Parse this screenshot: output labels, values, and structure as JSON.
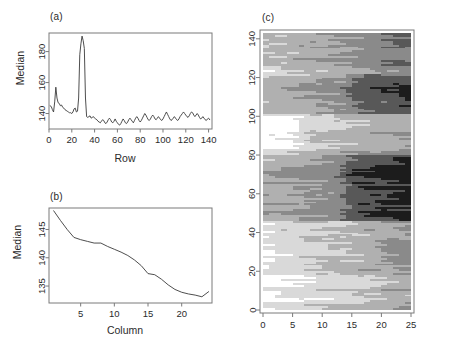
{
  "figure": {
    "panels": [
      {
        "id": "a",
        "label": "(a)"
      },
      {
        "id": "b",
        "label": "(b)"
      },
      {
        "id": "c",
        "label": "(c)"
      }
    ]
  },
  "chart_data": [
    {
      "type": "line",
      "panel": "(a)",
      "title": "",
      "xlabel": "Row",
      "ylabel": "Median",
      "xlim": [
        0,
        143
      ],
      "ylim": [
        130,
        192
      ],
      "xticks": [
        0,
        20,
        40,
        60,
        80,
        100,
        120,
        140
      ],
      "yticks": [
        140,
        160,
        180
      ],
      "grid": false,
      "x": [
        1,
        2,
        3,
        4,
        5,
        6,
        7,
        8,
        9,
        10,
        11,
        12,
        13,
        14,
        15,
        16,
        17,
        18,
        19,
        20,
        21,
        22,
        23,
        24,
        25,
        26,
        27,
        28,
        29,
        30,
        31,
        32,
        33,
        34,
        35,
        36,
        37,
        38,
        39,
        40,
        41,
        42,
        43,
        44,
        45,
        46,
        47,
        48,
        49,
        50,
        51,
        52,
        53,
        54,
        55,
        56,
        57,
        58,
        59,
        60,
        61,
        62,
        63,
        64,
        65,
        66,
        67,
        68,
        69,
        70,
        71,
        72,
        73,
        74,
        75,
        76,
        77,
        78,
        79,
        80,
        81,
        82,
        83,
        84,
        85,
        86,
        87,
        88,
        89,
        90,
        91,
        92,
        93,
        94,
        95,
        96,
        97,
        98,
        99,
        100,
        101,
        102,
        103,
        104,
        105,
        106,
        107,
        108,
        109,
        110,
        111,
        112,
        113,
        114,
        115,
        116,
        117,
        118,
        119,
        120,
        121,
        122,
        123,
        124,
        125,
        126,
        127,
        128,
        129,
        130,
        131,
        132,
        133,
        134,
        135,
        136,
        137,
        138,
        139,
        140,
        141
      ],
      "values": [
        145,
        144.5,
        142.5,
        141,
        147.5,
        157,
        150,
        147,
        146.5,
        145,
        145.5,
        144,
        143.5,
        142.5,
        142,
        141.5,
        141,
        140.5,
        140.5,
        140,
        141,
        143,
        143.5,
        141,
        141.5,
        150,
        178,
        185,
        190,
        187,
        182,
        150,
        138,
        137.5,
        138,
        138.5,
        137,
        137.5,
        138,
        137,
        136.5,
        136,
        135,
        134.5,
        134,
        135,
        136,
        135.5,
        134,
        133.5,
        134.5,
        136,
        137,
        136,
        134.5,
        134,
        135,
        136.5,
        135,
        134,
        133,
        132.5,
        133.5,
        135,
        136.5,
        135.5,
        134,
        133.5,
        134.5,
        136,
        137,
        136,
        135,
        134,
        135.5,
        137,
        138,
        137,
        135.5,
        134.5,
        135.5,
        137,
        138.5,
        140,
        139,
        137.5,
        136,
        135.5,
        136.5,
        138,
        139,
        138,
        136.5,
        136,
        137,
        138,
        137,
        136,
        135.5,
        136.5,
        138,
        139.5,
        141,
        139.5,
        138,
        136.5,
        135.5,
        136,
        137,
        138,
        137,
        136,
        135.5,
        136.5,
        138,
        139,
        140,
        141,
        140,
        139,
        138,
        137.5,
        138.5,
        140,
        141,
        140.5,
        139,
        138,
        139,
        140,
        139,
        137.5,
        136.5,
        137,
        138,
        137,
        136,
        135.5,
        136.5,
        137,
        136
      ]
    },
    {
      "type": "line",
      "panel": "(b)",
      "title": "",
      "xlabel": "Column",
      "ylabel": "Median",
      "xlim": [
        0.3,
        24.5
      ],
      "ylim": [
        132,
        148.8
      ],
      "xticks": [
        5,
        10,
        15,
        20
      ],
      "yticks": [
        135,
        140,
        145
      ],
      "grid": false,
      "x": [
        1,
        2,
        3,
        4,
        5,
        6,
        7,
        8,
        9,
        10,
        11,
        12,
        13,
        14,
        15,
        16,
        17,
        18,
        19,
        20,
        21,
        22,
        23,
        24
      ],
      "values": [
        148.3,
        146.6,
        145.0,
        143.6,
        143.2,
        142.9,
        142.6,
        142.6,
        142.0,
        141.5,
        141.0,
        140.4,
        139.6,
        138.6,
        137.2,
        137.0,
        136.2,
        135.2,
        134.4,
        133.9,
        133.6,
        133.4,
        133.1,
        134.0
      ]
    },
    {
      "type": "heatmap",
      "panel": "(c)",
      "title": "",
      "xlabel": "",
      "ylabel": "",
      "xlim": [
        0,
        25
      ],
      "ylim": [
        0,
        143
      ],
      "xticks": [
        0,
        5,
        10,
        15,
        20,
        25
      ],
      "yticks": [
        0,
        20,
        40,
        60,
        80,
        100,
        120,
        140
      ],
      "grid": false,
      "n_cols": 25,
      "n_rows": 143,
      "gray_levels": [
        "#ffffff",
        "#d9d9d9",
        "#b0b0b0",
        "#8a8a8a",
        "#585858",
        "#1c1c1c"
      ],
      "description": "Greyscale image plot of median values by row and column"
    }
  ],
  "colors": {
    "axis": "#7a7a7a",
    "text": "#2b2b2b",
    "line": "#3a3a3a",
    "background": "#ffffff"
  }
}
